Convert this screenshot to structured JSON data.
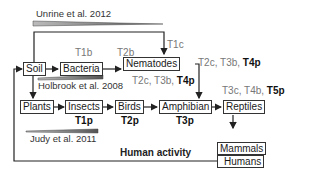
{
  "citations": {
    "unrine": "Unrine et al. 2012",
    "holbrook": "Holbrook et al. 2008",
    "judy": "Judy et al. 2011"
  },
  "nodes": {
    "soil": "Soil",
    "bacteria": "Bacteria",
    "nematodes": "Nematodes",
    "plants": "Plants",
    "insects": "Insects",
    "birds": "Birds",
    "amphibian": "Amphibian",
    "reptiles": "Reptiles",
    "mammals": "Mammals",
    "humans": "Humans"
  },
  "labels": {
    "t1b": "T1b",
    "t2b": "T2b",
    "t1c": "T1c",
    "nem_right_gray": "T2c, T3b,",
    "nem_right_bold": "T4p",
    "nem_below_gray": "T2c, T3b,",
    "nem_below_bold": "T4p",
    "rep_gray": "T3c, T4b,",
    "rep_bold": "T5p",
    "t1p": "T1p",
    "t2p": "T2p",
    "t3p": "T3p"
  },
  "human_activity": "Human activity"
}
